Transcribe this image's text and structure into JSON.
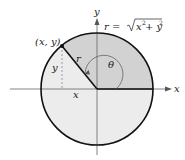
{
  "figure": {
    "axes": {
      "x_label": "x",
      "y_label": "y"
    },
    "point_label": "(x, y)",
    "radius_label": "r",
    "angle_label": "θ",
    "leg_x_label": "x",
    "leg_y_label": "y",
    "formula": {
      "lhs": "r = ",
      "radical_body_x": "x",
      "radical_exp1": "2",
      "radical_plus": " + y",
      "radical_exp2": "2"
    },
    "colors": {
      "sector_fill": "#d2d2d2",
      "disk_fill": "#ececec",
      "stroke": "#111111",
      "axis": "#666666"
    }
  }
}
